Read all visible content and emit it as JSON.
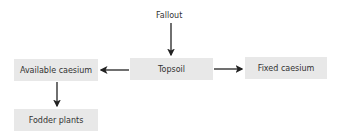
{
  "diagram": {
    "source_label": "Fallout",
    "nodes": {
      "topsoil": "Topsoil",
      "available": "Available caesium",
      "fixed": "Fixed caesium",
      "fodder": "Fodder plants"
    },
    "edges": [
      {
        "from": "Fallout",
        "to": "Topsoil"
      },
      {
        "from": "Topsoil",
        "to": "Available caesium"
      },
      {
        "from": "Topsoil",
        "to": "Fixed caesium"
      },
      {
        "from": "Available caesium",
        "to": "Fodder plants"
      }
    ],
    "colors": {
      "node_fill": "#e8e8e8",
      "arrow": "#222222",
      "text": "#333333"
    }
  }
}
